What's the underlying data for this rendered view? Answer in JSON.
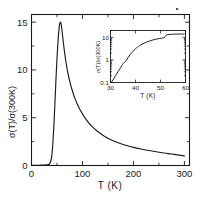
{
  "figure": {
    "background_color": "#ffffff",
    "line_color": "#1a1a1a",
    "speck_marker": "stray-ink-speck"
  },
  "chart_data": {
    "type": "line",
    "title": "",
    "xlabel": "T (K)",
    "ylabel": "σ(T)/σ(300K)",
    "xlim": [
      0,
      310
    ],
    "ylim": [
      0,
      15.8
    ],
    "grid": false,
    "legend": null,
    "xticks": [
      0,
      100,
      200,
      300
    ],
    "xtick_labels": [
      "0",
      "100",
      "200",
      "300"
    ],
    "xticks_minor": [
      50,
      150,
      250
    ],
    "yticks": [
      0,
      5,
      10,
      15
    ],
    "ytick_labels": [
      "0",
      "5",
      "10",
      "15"
    ],
    "yticks_minor": [
      2.5,
      7.5,
      12.5
    ],
    "series": [
      {
        "name": "sigma ratio vs temperature",
        "x": [
          0,
          5,
          10,
          15,
          20,
          25,
          30,
          33,
          35,
          36,
          38,
          40,
          42,
          44,
          46,
          48,
          50,
          52,
          54,
          55,
          56,
          57,
          58,
          59,
          60,
          62,
          65,
          68,
          72,
          76,
          80,
          85,
          90,
          95,
          100,
          110,
          120,
          130,
          140,
          150,
          160,
          170,
          180,
          190,
          200,
          215,
          230,
          245,
          260,
          275,
          290,
          300
        ],
        "y": [
          0.02,
          0.02,
          0.03,
          0.03,
          0.04,
          0.05,
          0.07,
          0.1,
          0.16,
          0.22,
          0.5,
          1.1,
          2.4,
          4.3,
          6.6,
          9.0,
          11.2,
          13.0,
          14.3,
          14.75,
          14.95,
          15.0,
          14.85,
          14.5,
          14.05,
          13.1,
          11.8,
          10.7,
          9.5,
          8.6,
          7.85,
          7.05,
          6.4,
          5.85,
          5.4,
          4.62,
          4.02,
          3.55,
          3.17,
          2.86,
          2.6,
          2.38,
          2.2,
          2.04,
          1.9,
          1.72,
          1.57,
          1.44,
          1.31,
          1.2,
          1.08,
          1.0
        ]
      }
    ]
  },
  "inset_chart_data": {
    "type": "line",
    "title": "",
    "xlabel": "T (K)",
    "ylabel": "σ(T)/σ(300K)",
    "yscale": "log",
    "xlim": [
      30,
      60
    ],
    "ylim": [
      0.1,
      20
    ],
    "grid": false,
    "legend": null,
    "xticks": [
      30,
      40,
      50,
      60
    ],
    "xtick_labels": [
      "30",
      "40",
      "50",
      "60"
    ],
    "yticks": [
      0.1,
      1,
      10
    ],
    "ytick_labels": [
      "0.1",
      "1",
      "10"
    ],
    "series": [
      {
        "name": "sigma ratio vs temperature (log scale)",
        "x": [
          30.2,
          31,
          32,
          33,
          34,
          34.8,
          35.3,
          35.8,
          36.3,
          37,
          38,
          39,
          40,
          41.5,
          43,
          44.5,
          46,
          47.5,
          49,
          50,
          51,
          51.6,
          52,
          52.4,
          53,
          54,
          55,
          56.5,
          58,
          59.5
        ],
        "y": [
          0.1,
          0.13,
          0.2,
          0.3,
          0.45,
          0.62,
          0.75,
          0.8,
          0.95,
          1.25,
          1.8,
          2.4,
          3.1,
          4.2,
          5.2,
          6.2,
          7.1,
          7.9,
          8.6,
          9.0,
          9.4,
          9.7,
          11.5,
          12.6,
          13.2,
          13.5,
          13.7,
          13.85,
          13.95,
          14.0
        ]
      }
    ]
  }
}
